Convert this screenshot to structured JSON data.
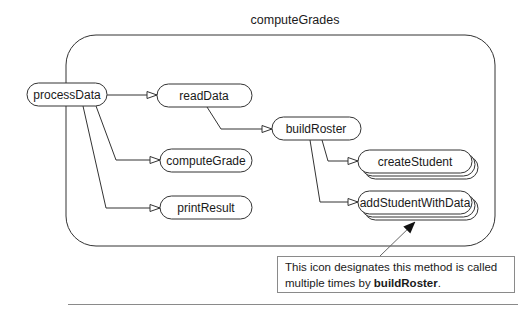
{
  "diagram": {
    "title": "computeGrades",
    "nodes": {
      "processData": "processData",
      "readData": "readData",
      "buildRoster": "buildRoster",
      "computeGrade": "computeGrade",
      "printResult": "printResult",
      "createStudent": "createStudent",
      "addStudentWithData": "addStudentWithData"
    },
    "edges": [
      {
        "from": "processData",
        "to": "readData"
      },
      {
        "from": "processData",
        "to": "computeGrade"
      },
      {
        "from": "processData",
        "to": "printResult"
      },
      {
        "from": "readData",
        "to": "buildRoster"
      },
      {
        "from": "buildRoster",
        "to": "createStudent",
        "multiple": true
      },
      {
        "from": "buildRoster",
        "to": "addStudentWithData",
        "multiple": true
      }
    ],
    "callout": {
      "text_before": "This icon designates this method is called multiple times by ",
      "bold": "buildRoster",
      "text_after": "."
    }
  }
}
